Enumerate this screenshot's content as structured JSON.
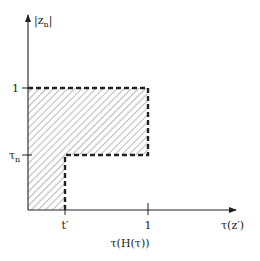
{
  "diagram": {
    "y_axis_label": "|z",
    "y_axis_label_sub": "n",
    "y_axis_label_close": "|",
    "x_axis_label": "τ(z′)",
    "x_caption": "τ(H(τ))",
    "y_ticks": [
      {
        "label": "1",
        "sub": ""
      },
      {
        "label": "τ",
        "sub": "n"
      }
    ],
    "x_ticks": [
      {
        "label": "t′"
      },
      {
        "label": "1"
      }
    ],
    "region": {
      "description": "Hatched L-shaped region bounded by dashed line",
      "fill": "diagonal hatch",
      "border_style": "dashed"
    },
    "colors": {
      "line": "#222222",
      "hatch": "#555555",
      "background": "#ffffff"
    }
  }
}
